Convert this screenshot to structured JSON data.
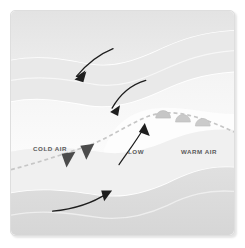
{
  "figure": {
    "type": "weather-front-diagram",
    "panel": {
      "background_color": "#efefef",
      "border_color": "#dedede",
      "corner_radius_px": 5
    },
    "labels": [
      {
        "id": "cold-air",
        "text": "COLD AIR",
        "x": 22,
        "y": 140,
        "color": "#5a5a5a"
      },
      {
        "id": "low-pressure",
        "text": "LOW",
        "x": 117,
        "y": 143,
        "color": "#5a5a5a"
      },
      {
        "id": "warm-air",
        "text": "WARM AIR",
        "x": 170,
        "y": 143,
        "color": "#5a5a5a"
      }
    ],
    "front_line": {
      "name": "frontal-boundary",
      "style": "dashed",
      "color": "#c6c6c6",
      "dash_pattern": "4 3",
      "width_px": 1.6
    },
    "cold_front_symbols": {
      "name": "cold-front-triangles",
      "shape": "triangle",
      "count": 2,
      "color": "#4a4a4a",
      "direction": "down-left"
    },
    "warm_front_symbols": {
      "name": "warm-front-semicircles",
      "shape": "semicircle",
      "count": 3,
      "color": "#c4c4c4",
      "edge_color": "#b4b4b4",
      "direction": "up-right"
    },
    "arrows": [
      {
        "id": "cold-air-advance",
        "label": "",
        "color": "#1c1c1c",
        "direction": "down-left",
        "region": "upper-left"
      },
      {
        "id": "cold-air-inflow",
        "label": "",
        "color": "#1c1c1c",
        "direction": "down-left",
        "region": "center"
      },
      {
        "id": "warm-air-rise",
        "label": "",
        "color": "#1c1c1c",
        "direction": "up",
        "region": "center-low"
      },
      {
        "id": "warm-air-inflow",
        "label": "",
        "color": "#1c1c1c",
        "direction": "up-right",
        "region": "lower-left"
      }
    ],
    "air_bands": {
      "name": "air-mass-bands",
      "colors": [
        "#e4e4e4",
        "#eeeeee",
        "#f7f7f7",
        "#fbfbfb",
        "#d9d9d9"
      ],
      "separator_color": "#ffffff"
    }
  }
}
